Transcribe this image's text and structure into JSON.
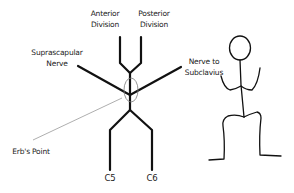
{
  "diagram": {
    "labels": {
      "anterior_division": [
        "Anterior",
        "Division"
      ],
      "posterior_division": [
        "Posterior",
        "Division"
      ],
      "suprascapular_nerve": [
        "Suprascapular",
        "Nerve"
      ],
      "nerve_to_subclavius": [
        "Nerve to",
        "Subclavius"
      ],
      "erbs_point": "Erb's Point",
      "c5": "C5",
      "c6": "C6"
    },
    "colors": {
      "stroke": "#111111",
      "pointer": "#999999",
      "ellipse": "#777777",
      "text": "#222222"
    }
  }
}
